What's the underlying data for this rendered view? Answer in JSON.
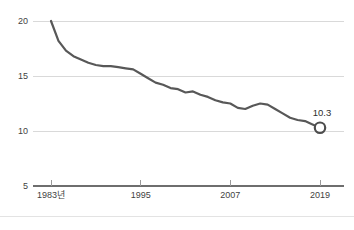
{
  "chart_data": {
    "type": "line",
    "title": "",
    "subtitle": "",
    "xlabel": "",
    "ylabel": "",
    "grid": true,
    "legend": "none",
    "xlim": [
      1983,
      2019
    ],
    "ylim": [
      5,
      20
    ],
    "y_ticks": [
      "20",
      "15",
      "10",
      "5"
    ],
    "y_tick_values": [
      20,
      15,
      10,
      5
    ],
    "x_ticks": [
      "1983년",
      "1995",
      "2007",
      "2019"
    ],
    "x_tick_values": [
      1983,
      1995,
      2007,
      2019
    ],
    "x": [
      1983,
      1984,
      1985,
      1986,
      1987,
      1988,
      1989,
      1990,
      1991,
      1992,
      1993,
      1994,
      1995,
      1996,
      1997,
      1998,
      1999,
      2000,
      2001,
      2002,
      2003,
      2004,
      2005,
      2006,
      2007,
      2008,
      2009,
      2010,
      2011,
      2012,
      2013,
      2014,
      2015,
      2016,
      2017,
      2018,
      2019
    ],
    "values": [
      20.0,
      18.2,
      17.3,
      16.8,
      16.5,
      16.2,
      16.0,
      15.9,
      15.9,
      15.8,
      15.7,
      15.6,
      15.2,
      14.8,
      14.4,
      14.2,
      13.9,
      13.8,
      13.5,
      13.6,
      13.3,
      13.1,
      12.8,
      12.6,
      12.5,
      12.1,
      12.0,
      12.3,
      12.5,
      12.4,
      12.0,
      11.6,
      11.2,
      11.0,
      10.9,
      10.6,
      10.3
    ],
    "series": [
      {
        "name": "series-1",
        "color": "#585858",
        "values": [
          20.0,
          18.2,
          17.3,
          16.8,
          16.5,
          16.2,
          16.0,
          15.9,
          15.9,
          15.8,
          15.7,
          15.6,
          15.2,
          14.8,
          14.4,
          14.2,
          13.9,
          13.8,
          13.5,
          13.6,
          13.3,
          13.1,
          12.8,
          12.6,
          12.5,
          12.1,
          12.0,
          12.3,
          12.5,
          12.4,
          12.0,
          11.6,
          11.2,
          11.0,
          10.9,
          10.6,
          10.3
        ]
      }
    ],
    "annotations": [
      {
        "name": "endpoint-value-label",
        "text": "10.3",
        "x": 2019,
        "y": 10.3
      }
    ],
    "endpoint_marker": {
      "x": 2019,
      "y": 10.3,
      "shape": "circle",
      "fill": "#ffffff",
      "stroke": "#4d4d4d"
    },
    "colors": {
      "line": "#585858",
      "grid": "#d9d9d9",
      "axis": "#6e6e6e",
      "text": "#3f3f3f",
      "background": "#ffffff"
    }
  }
}
